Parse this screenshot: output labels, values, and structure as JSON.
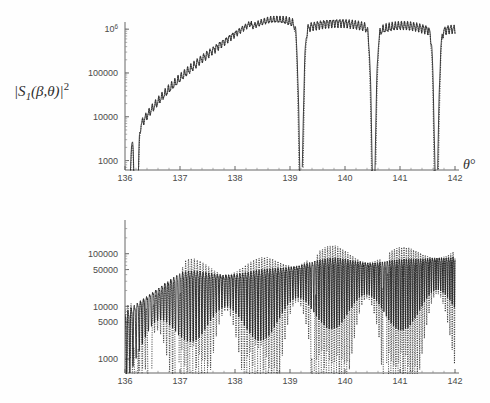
{
  "page": {
    "background_color": "#fefefe",
    "foreground_color": "#1d1d1d",
    "width": 490,
    "height": 403
  },
  "chart_data": [
    {
      "id": "panel-top",
      "type": "line",
      "title": "",
      "xlabel": "θ°",
      "ylabel": "|S₁(β,θ)|²",
      "ylabel_parts": {
        "prefix": "|S",
        "sub": "1",
        "mid": "(β,θ)|",
        "sup": "2"
      },
      "yscale": "log",
      "xlim": [
        136,
        142
      ],
      "ylim": [
        400,
        2000000
      ],
      "grid": false,
      "legend": "none",
      "xticks": [
        136,
        137,
        138,
        139,
        140,
        141,
        142
      ],
      "xtick_labels": [
        "136",
        "137",
        "138",
        "139",
        "140",
        "141",
        "142"
      ],
      "yticks": [
        1000,
        10000,
        100000,
        1000000
      ],
      "ytick_labels": [
        "1000",
        "10000",
        "100000",
        "10⁶"
      ],
      "ytick_label_top_base": "10",
      "ytick_label_top_exp": "6",
      "series": [
        {
          "name": "solid",
          "style": "solid",
          "color": "#1d1d1d",
          "description": "Exact |S1|^2 angular scattering intensity; rippled envelope with deep minima near 136.05, 136.2, 139.2, 140.5, 141.65"
        },
        {
          "name": "dotted",
          "style": "dotted",
          "color": "#2a2a2a",
          "description": "Asymptotic approximation of |S1|^2; tracks solid curve but dips far deeper at the minima"
        }
      ],
      "envelope_peaks_deg": [
        136.05,
        136.3,
        136.6,
        137.0,
        137.5,
        138.25,
        139.0,
        139.9,
        140.9,
        142.0
      ],
      "minima_deg": [
        136.05,
        136.2,
        139.2,
        140.52,
        141.65
      ],
      "max_value": 1300000
    },
    {
      "id": "panel-bottom",
      "type": "line",
      "title": "",
      "xlabel": "θ°",
      "ylabel": "|S₂(β,θ)|²",
      "ylabel_parts": {
        "prefix": "|S",
        "sub": "2",
        "mid": "(β,θ)|",
        "sup": "2"
      },
      "yscale": "log",
      "xlim": [
        136,
        142
      ],
      "ylim": [
        400,
        400000
      ],
      "grid": false,
      "legend": "none",
      "xticks": [
        136,
        137,
        138,
        139,
        140,
        141,
        142
      ],
      "xtick_labels": [
        "136",
        "137",
        "138",
        "139",
        "140",
        "141",
        "142"
      ],
      "yticks": [
        1000,
        5000,
        10000,
        50000,
        100000
      ],
      "ytick_labels": [
        "1000",
        "5000",
        "10000",
        "50000",
        "100000"
      ],
      "series": [
        {
          "name": "solid",
          "style": "solid",
          "color": "#1d1d1d",
          "description": "Exact |S2|^2; dense high-frequency ripple rising from ~2e4 at 136° to ~2e5 near 141.5°"
        },
        {
          "name": "dotted",
          "style": "dotted",
          "color": "#2a2a2a",
          "description": "Asymptotic |S2|^2; same ripple but with much deeper periodic nulls reaching below 1000"
        }
      ],
      "deep_nulls_deg": [
        136.2,
        136.45,
        136.95,
        139.42,
        140.72
      ],
      "max_value": 230000
    }
  ]
}
